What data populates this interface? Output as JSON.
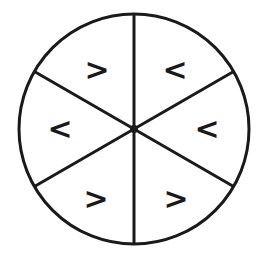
{
  "diagram": {
    "type": "circle-divided-into-sectors",
    "center": [
      134,
      128
    ],
    "radius": 115,
    "stroke_color": "#1a1a1a",
    "sector_count": 6,
    "sectors": [
      {
        "position": "top-left",
        "symbol": ">",
        "x": 97,
        "y": 69
      },
      {
        "position": "top-right",
        "symbol": "<",
        "x": 175,
        "y": 69
      },
      {
        "position": "left",
        "symbol": "<",
        "x": 60,
        "y": 128
      },
      {
        "position": "right",
        "symbol": "<",
        "x": 207,
        "y": 128
      },
      {
        "position": "bottom-left",
        "symbol": ">",
        "x": 96,
        "y": 198
      },
      {
        "position": "bottom-right",
        "symbol": ">",
        "x": 176,
        "y": 198
      }
    ]
  }
}
